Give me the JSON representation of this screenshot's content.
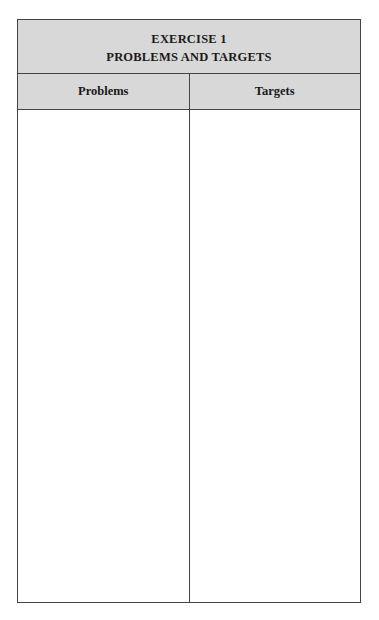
{
  "worksheet": {
    "title_line1": "EXERCISE 1",
    "title_line2": "PROBLEMS AND TARGETS",
    "columns": [
      {
        "header": "Problems",
        "content": ""
      },
      {
        "header": "Targets",
        "content": ""
      }
    ]
  },
  "colors": {
    "header_background": "#d8d8d8",
    "border": "#444444",
    "text": "#1a1a1a"
  }
}
